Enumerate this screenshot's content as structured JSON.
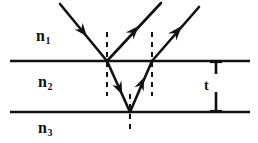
{
  "figure": {
    "background_color": "#ffffff",
    "ink_color": "#111111",
    "width": 258,
    "height": 143
  },
  "labels": {
    "medium_top": {
      "base": "n",
      "subscript": "1"
    },
    "medium_middle": {
      "base": "n",
      "subscript": "2"
    },
    "medium_bottom": {
      "base": "n",
      "subscript": "3"
    },
    "thickness": "t"
  },
  "interfaces": [
    {
      "name": "upper-interface",
      "y": 61,
      "x_start": 10,
      "x_end": 250
    },
    {
      "name": "lower-interface",
      "y": 112,
      "x_start": 10,
      "x_end": 250
    }
  ],
  "normals": [
    {
      "name": "normal-at-first-incidence",
      "x": 107,
      "y_top": 32,
      "y_bottom": 96
    },
    {
      "name": "normal-at-second-exit",
      "x": 152,
      "y_top": 32,
      "y_bottom": 96
    },
    {
      "name": "normal-at-bottom-reflection",
      "x": 130,
      "y_top": 96,
      "y_bottom": 130
    }
  ],
  "rays": [
    {
      "name": "incident-ray",
      "from": [
        60,
        4
      ],
      "to": [
        107,
        61
      ],
      "arrow_at": 0.5
    },
    {
      "name": "reflected-ray-first-surface",
      "from": [
        107,
        61
      ],
      "to": [
        160,
        4
      ],
      "arrow_at": 0.55
    },
    {
      "name": "refracted-ray-downward",
      "from": [
        107,
        61
      ],
      "to": [
        130,
        112
      ],
      "arrow_at": 0.55
    },
    {
      "name": "internally-reflected-ray-upward",
      "from": [
        130,
        112
      ],
      "to": [
        152,
        61
      ],
      "arrow_at": 0.6
    },
    {
      "name": "transmitted-ray-second-surface",
      "from": [
        152,
        61
      ],
      "to": [
        198,
        8
      ],
      "arrow_at": 0.58
    }
  ],
  "thickness_marker": {
    "name": "film-thickness-marker",
    "x": 216,
    "y_top": 61,
    "y_bottom": 112,
    "cap_half_width": 6,
    "label": "t"
  }
}
